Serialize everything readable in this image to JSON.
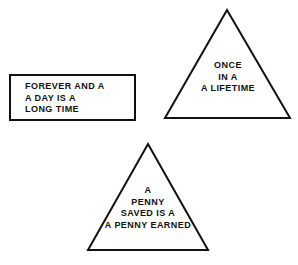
{
  "canvas": {
    "width": 298,
    "height": 265,
    "background_color": "#ffffff",
    "stroke_color": "#111111",
    "text_color": "#111111"
  },
  "shapes": [
    {
      "id": "rectangle",
      "kind": "rectangle",
      "name": "forever-and-a-day-rectangle",
      "text_align": "left",
      "lines": [
        "FOREVER AND A",
        "A DAY IS A",
        "LONG TIME"
      ],
      "text": "FOREVER AND A\nA DAY IS A\nLONG TIME"
    },
    {
      "id": "triangle-top",
      "kind": "triangle",
      "name": "once-in-a-lifetime-triangle",
      "text_align": "center",
      "lines": [
        "ONCE",
        "IN A",
        "A LIFETIME"
      ],
      "text": "ONCE\nIN A\nA LIFETIME"
    },
    {
      "id": "triangle-bottom",
      "kind": "triangle",
      "name": "a-penny-saved-triangle",
      "text_align": "center",
      "lines": [
        "A",
        "PENNY",
        "SAVED IS A",
        "A PENNY EARNED"
      ],
      "text": "A\nPENNY\nSAVED IS A\nA PENNY EARNED"
    }
  ]
}
